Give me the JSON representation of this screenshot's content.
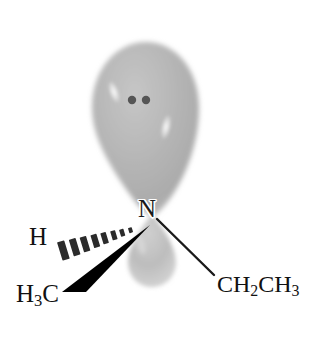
{
  "figure": {
    "background_color": "#ffffff",
    "width": 318,
    "height": 344
  },
  "central_atom": {
    "symbol": "N",
    "x": 152,
    "y": 210
  },
  "lone_pair": {
    "label": "lone pair electrons",
    "dot_color": "#555555",
    "dots": [
      {
        "x": 132,
        "y": 100,
        "r": 4.2
      },
      {
        "x": 146,
        "y": 100,
        "r": 4.2
      }
    ]
  },
  "orbital": {
    "name": "sp3-hybrid-orbital",
    "fill_color": "#b4b4b4",
    "edge_color": "#cfcfcf",
    "highlight_color": "#f4f4f4",
    "major_lobe": {
      "label": "large front lobe",
      "top_y": 42,
      "bottom_y": 216,
      "left_x": 92,
      "right_x": 199,
      "center_x": 146
    },
    "minor_lobe": {
      "label": "small back lobe",
      "top_y": 214,
      "bottom_y": 287,
      "center_x": 152,
      "width": 48
    },
    "highlights": [
      {
        "x": 114,
        "y": 92,
        "rx": 5,
        "ry": 12,
        "rotate": -20
      },
      {
        "x": 166,
        "y": 127,
        "rx": 5,
        "ry": 13,
        "rotate": 12
      }
    ]
  },
  "substituents": [
    {
      "id": "hydrogen",
      "label": "H",
      "bond_style": "hashed-wedge",
      "label_x": 29,
      "label_y": 224,
      "dash_count": 8,
      "color": "#2b2b2b"
    },
    {
      "id": "methyl",
      "label_parts": {
        "lead": "H",
        "sub": "3",
        "tail": "C"
      },
      "label_text": "H3C",
      "bond_style": "solid-wedge",
      "label_x": 16,
      "label_y": 281,
      "color": "#000000"
    },
    {
      "id": "ethyl",
      "label_parts": {
        "a": "CH",
        "sub1": "2",
        "b": "CH",
        "sub2": "3"
      },
      "label_text": "CH2CH3",
      "bond_style": "plain-line",
      "label_x": 217,
      "label_y": 272,
      "color": "#1a1a1a"
    }
  ],
  "bonds": {
    "hashed": {
      "from_x": 148,
      "from_y": 222,
      "to_x": 62,
      "to_y": 249
    },
    "wedge": {
      "apex_x": 149,
      "apex_y": 226,
      "base_left_x": 62,
      "base_left_y": 293,
      "base_right_x": 84,
      "base_right_y": 277
    },
    "plain": {
      "from_x": 157,
      "from_y": 219,
      "to_x": 214,
      "to_y": 275,
      "stroke_width": 2.4
    }
  }
}
